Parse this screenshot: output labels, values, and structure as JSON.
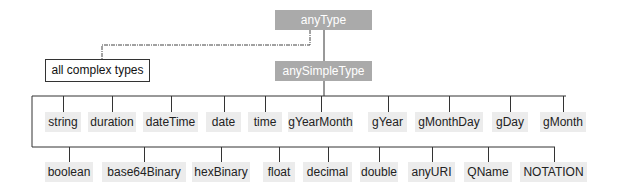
{
  "root": {
    "label": "anyType"
  },
  "complex": {
    "label": "all complex types"
  },
  "simple": {
    "label": "anySimpleType"
  },
  "row1": [
    {
      "label": "string",
      "x": 45,
      "w": 36
    },
    {
      "label": "duration",
      "x": 88,
      "w": 48
    },
    {
      "label": "dateTime",
      "x": 143,
      "w": 55
    },
    {
      "label": "date",
      "x": 206,
      "w": 35
    },
    {
      "label": "time",
      "x": 248,
      "w": 34
    },
    {
      "label": "gYearMonth",
      "x": 288,
      "w": 65
    },
    {
      "label": "gYear",
      "x": 368,
      "w": 39
    },
    {
      "label": "gMonthDay",
      "x": 415,
      "w": 68
    },
    {
      "label": "gDay",
      "x": 492,
      "w": 36
    },
    {
      "label": "gMonth",
      "x": 540,
      "w": 46
    }
  ],
  "row2": [
    {
      "label": "boolean",
      "x": 45,
      "w": 48
    },
    {
      "label": "base64Binary",
      "x": 102,
      "w": 84
    },
    {
      "label": "hexBinary",
      "x": 192,
      "w": 58
    },
    {
      "label": "float",
      "x": 263,
      "w": 32
    },
    {
      "label": "decimal",
      "x": 303,
      "w": 49
    },
    {
      "label": "double",
      "x": 360,
      "w": 38
    },
    {
      "label": "anyURI",
      "x": 408,
      "w": 47
    },
    {
      "label": "QName",
      "x": 464,
      "w": 48
    },
    {
      "label": "NOTATION",
      "x": 520,
      "w": 67
    }
  ]
}
